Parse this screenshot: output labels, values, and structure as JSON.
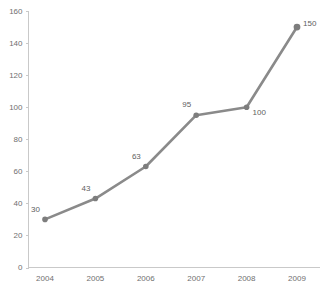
{
  "chart_data": {
    "type": "line",
    "title": "",
    "subtitle": "",
    "xlabel": "",
    "ylabel": "",
    "categories": [
      "2004",
      "2005",
      "2006",
      "2007",
      "2008",
      "2009"
    ],
    "values": [
      30,
      43,
      63,
      95,
      100,
      150
    ],
    "series": [
      {
        "name": "",
        "values": [
          30,
          43,
          63,
          95,
          100,
          150
        ]
      }
    ],
    "data_labels": [
      "30",
      "43",
      "63",
      "95",
      "100",
      "150"
    ],
    "data_label_positions": [
      "above-left",
      "above-left",
      "above-left",
      "above-left",
      "right",
      "above-right"
    ],
    "ylim": [
      0,
      160
    ],
    "yticks": [
      0,
      20,
      40,
      60,
      80,
      100,
      120,
      140,
      160
    ],
    "ytick_labels": [
      "0",
      "20",
      "40",
      "60",
      "80",
      "100",
      "120",
      "140",
      "160"
    ],
    "xtick_labels": [
      "2004",
      "2005",
      "2006",
      "2007",
      "2008",
      "2009"
    ],
    "grid": false,
    "legend": false,
    "legend_position": "none",
    "colors": {
      "line": "#8a8a8a",
      "marker": "#7d7d7d",
      "axis": "#c9c9c9",
      "tick_text": "#6f6f6f",
      "label_text": "#5e5e5e",
      "background": "#ffffff"
    }
  }
}
